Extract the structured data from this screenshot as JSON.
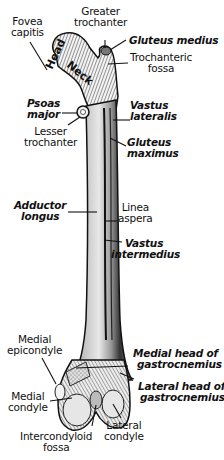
{
  "figure": {
    "bone_labels": {
      "head": "Head",
      "neck": "Neck"
    },
    "labels": [
      {
        "id": "fovea-capitis",
        "lines": [
          "Fovea",
          "capitis"
        ],
        "style": "regular"
      },
      {
        "id": "greater-trochanter",
        "lines": [
          "Greater",
          "trochanter"
        ],
        "style": "regular"
      },
      {
        "id": "gluteus-medius",
        "lines": [
          "Gluteus medius"
        ],
        "style": "italic"
      },
      {
        "id": "trochanteric-fossa",
        "lines": [
          "Trochanteric",
          "fossa"
        ],
        "style": "regular"
      },
      {
        "id": "psoas-major",
        "lines": [
          "Psoas",
          "major"
        ],
        "style": "italic"
      },
      {
        "id": "lesser-trochanter",
        "lines": [
          "Lesser",
          "trochanter"
        ],
        "style": "regular"
      },
      {
        "id": "vastus-lateralis",
        "lines": [
          "Vastus",
          "lateralis"
        ],
        "style": "italic"
      },
      {
        "id": "gluteus-maximus",
        "lines": [
          "Gluteus",
          "maximus"
        ],
        "style": "italic"
      },
      {
        "id": "adductor-longus",
        "lines": [
          "Adductor",
          "longus"
        ],
        "style": "italic"
      },
      {
        "id": "linea-aspera",
        "lines": [
          "Linea",
          "aspera"
        ],
        "style": "regular"
      },
      {
        "id": "vastus-intermedius",
        "lines": [
          "Vastus",
          "intermedius"
        ],
        "style": "italic"
      },
      {
        "id": "medial-epicondyle",
        "lines": [
          "Medial",
          "epicondyle"
        ],
        "style": "regular"
      },
      {
        "id": "medial-head-gastrocnemius",
        "lines": [
          "Medial head of",
          "gastrocnemius"
        ],
        "style": "italic"
      },
      {
        "id": "lateral-head-gastrocnemius",
        "lines": [
          "Lateral head of",
          "gastrocnemius"
        ],
        "style": "italic"
      },
      {
        "id": "medial-condyle",
        "lines": [
          "Medial",
          "condyle"
        ],
        "style": "regular"
      },
      {
        "id": "lateral-condyle",
        "lines": [
          "Lateral",
          "condyle"
        ],
        "style": "regular"
      },
      {
        "id": "intercondyloid-fossa",
        "lines": [
          "Intercondyloid",
          "fossa"
        ],
        "style": "regular"
      }
    ]
  }
}
